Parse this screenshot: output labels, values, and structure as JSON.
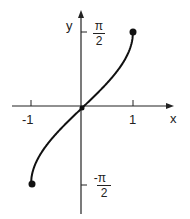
{
  "chart_data": {
    "type": "line",
    "title": "",
    "function": "y = arcsin(x)",
    "xlabel": "x",
    "ylabel": "y",
    "x_ticks": [
      {
        "value": -1,
        "label": "-1"
      },
      {
        "value": 1,
        "label": "1"
      }
    ],
    "y_ticks": [
      {
        "value": 1.5708,
        "label_num": "π",
        "label_den": "2"
      },
      {
        "value": -1.5708,
        "label_num": "-π",
        "label_den": "2"
      }
    ],
    "series": [
      {
        "name": "arcsin",
        "x": [
          -1,
          -0.9,
          -0.75,
          -0.5,
          -0.25,
          0,
          0.25,
          0.5,
          0.75,
          0.9,
          1
        ],
        "y": [
          -1.5708,
          -1.1198,
          -0.8481,
          -0.5236,
          -0.2527,
          0,
          0.2527,
          0.5236,
          0.8481,
          1.1198,
          1.5708
        ]
      }
    ],
    "points": [
      {
        "x": -1,
        "y": -1.5708,
        "style": "filled"
      },
      {
        "x": 0,
        "y": 0,
        "style": "filled"
      },
      {
        "x": 1,
        "y": 1.5708,
        "style": "filled"
      }
    ],
    "xlim": [
      -1.45,
      1.7
    ],
    "ylim": [
      -1.85,
      1.85
    ],
    "grid": false,
    "legend": "none"
  },
  "labels": {
    "x_axis": "x",
    "y_axis": "y",
    "tick_neg1": "-1",
    "tick_1": "1",
    "pi_top_num": "π",
    "pi_top_den": "2",
    "pi_bot_num": "-π",
    "pi_bot_den": "2"
  }
}
